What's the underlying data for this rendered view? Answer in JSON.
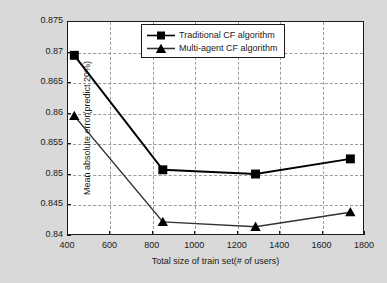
{
  "chart_data": {
    "type": "line",
    "title": "",
    "xlabel": "Total size of train set(# of users)",
    "ylabel": "Mean absolute error(predict 20%)",
    "xlim": [
      400,
      1800
    ],
    "ylim": [
      0.84,
      0.875
    ],
    "xticks": [
      400,
      600,
      800,
      1000,
      1200,
      1400,
      1600,
      1800
    ],
    "yticks": [
      0.84,
      0.845,
      0.85,
      0.855,
      0.86,
      0.865,
      0.87,
      0.875
    ],
    "xtick_labels": [
      "400",
      "600",
      "800",
      "1000",
      "1200",
      "1400",
      "1600",
      "1800"
    ],
    "ytick_labels": [
      "0.84",
      "0.845",
      "0.85",
      "0.855",
      "0.86",
      "0.865",
      "0.87",
      "0.875"
    ],
    "grid": true,
    "legend_position": "top-center",
    "x": [
      430,
      850,
      1290,
      1740
    ],
    "series": [
      {
        "name": "Traditional CF algorithm",
        "marker": "square",
        "color": "#000000",
        "values": [
          0.8695,
          0.8506,
          0.8499,
          0.8524
        ]
      },
      {
        "name": "Multi-agent CF algorithm",
        "marker": "triangle",
        "color": "#333333",
        "values": [
          0.8595,
          0.842,
          0.8412,
          0.8436
        ]
      }
    ]
  },
  "figure": {
    "background_color": "#d9d9d9",
    "axes_background_color": "#ffffff",
    "grid_color": "#9a9a9a",
    "axis_color": "#1a1a1a"
  }
}
